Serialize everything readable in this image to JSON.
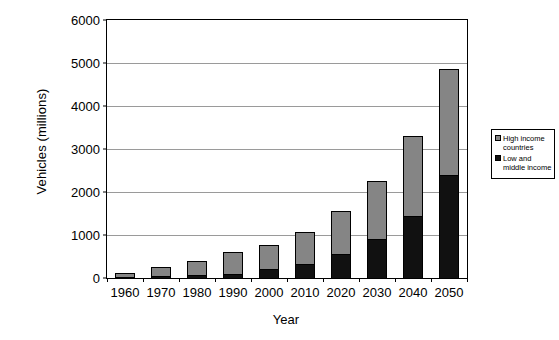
{
  "chart_data": {
    "type": "bar",
    "barmode": "stacked",
    "title": "",
    "xlabel": "Year",
    "ylabel": "Vehicles (millions)",
    "categories": [
      "1960",
      "1970",
      "1980",
      "1990",
      "2000",
      "2010",
      "2020",
      "2030",
      "2040",
      "2050"
    ],
    "series": [
      {
        "name": "Low and middle income",
        "color": "#111111",
        "values": [
          30,
          50,
          70,
          100,
          200,
          330,
          550,
          900,
          1450,
          2400
        ]
      },
      {
        "name": "High income countries",
        "color": "#858585",
        "values": [
          90,
          200,
          330,
          500,
          560,
          750,
          1000,
          1350,
          1850,
          2450
        ]
      }
    ],
    "totals": [
      120,
      250,
      400,
      600,
      760,
      1080,
      1550,
      2250,
      3300,
      4850
    ],
    "ylim": [
      0,
      6000
    ],
    "yticks": [
      0,
      1000,
      2000,
      3000,
      4000,
      5000,
      6000
    ],
    "ytick_labels": [
      "0",
      "1000",
      "2000",
      "3000",
      "4000",
      "5000",
      "6000"
    ],
    "grid": "horizontal",
    "legend_position": "right"
  },
  "legend": {
    "items": [
      {
        "label": "High income countries",
        "swatch": "high"
      },
      {
        "label": "Low and middle income",
        "swatch": "low"
      }
    ]
  },
  "axes": {
    "x_title": "Year",
    "y_title": "Vehicles (millions)"
  }
}
